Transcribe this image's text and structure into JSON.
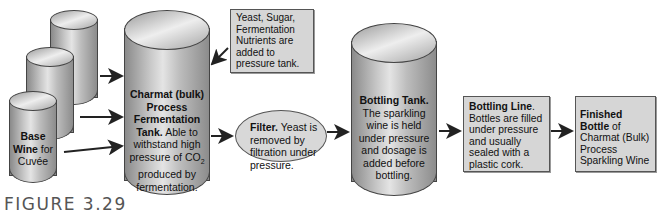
{
  "diagram": {
    "base_wine_tank": {
      "line1": "Base",
      "line2": "Wine",
      "line3": "for",
      "line4": "Cuvée"
    },
    "fermentation_tank": {
      "bold": "Charmat (bulk) Process Fermentation Tank.",
      "text": "Able to withstand high pressure of CO",
      "subscript": "2",
      "text_end": "produced by fermentation."
    },
    "additives_note": {
      "text": "Yeast, Sugar, Fermentation Nutrients are added to pressure tank."
    },
    "filter": {
      "bold": "Filter.",
      "text": "Yeast is removed by filtration under pressure."
    },
    "bottling_tank": {
      "bold": "Bottling Tank.",
      "text": "The sparkling wine is held under pressure and dosage is added before bottling."
    },
    "bottling_line": {
      "bold": "Bottling Line",
      "dot": ".",
      "text": "Bottles are filled under pressure and usually sealed with a plastic cork."
    },
    "finished_bottle": {
      "bold": "Finished Bottle",
      "text": "of Charmat (Bulk) Process Sparkling Wine"
    },
    "colors": {
      "tank_fill": "#c0c0c0",
      "box_fill": "#d6d6d6",
      "outline": "#444444",
      "caption": "#555555"
    }
  },
  "caption": {
    "label": "FIGURE 3.29"
  }
}
